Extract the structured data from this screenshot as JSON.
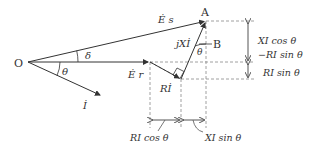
{
  "diagram": {
    "colors": {
      "line": "#333333",
      "dash": "#888888",
      "background": "#ffffff"
    },
    "points": {
      "origin": "O",
      "tip": "A",
      "foot": "B"
    },
    "vectors": {
      "es": "Ė s",
      "er": "Ė r",
      "i": "İ",
      "ri": "Rİ",
      "jxi": "jXİ"
    },
    "angles": {
      "delta": "δ",
      "theta_origin": "θ",
      "theta_b": "θ"
    },
    "dimensions": {
      "vertical_upper_line1": "XI cos θ",
      "vertical_upper_line2": "−RI sin θ",
      "vertical_lower": "RI sin θ",
      "horizontal_left": "RI cos θ",
      "horizontal_right": "XI sin θ"
    }
  }
}
